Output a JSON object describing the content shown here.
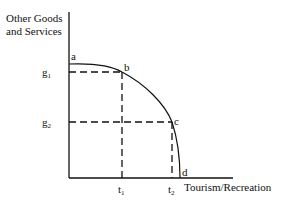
{
  "diagram": {
    "type": "production-possibility-frontier",
    "y_axis_label_line1": "Other Goods",
    "y_axis_label_line2": "and Services",
    "x_axis_label": "Tourism/Recreation",
    "points": {
      "a": "a",
      "b": "b",
      "c": "c",
      "d": "d"
    },
    "y_ticks": {
      "g1_base": "g",
      "g1_sub": "1",
      "g2_base": "g",
      "g2_sub": "2"
    },
    "x_ticks": {
      "t1_base": "t",
      "t1_sub": "1",
      "t2_base": "t",
      "t2_sub": "2"
    },
    "colors": {
      "line": "#111111",
      "background": "#ffffff"
    }
  }
}
